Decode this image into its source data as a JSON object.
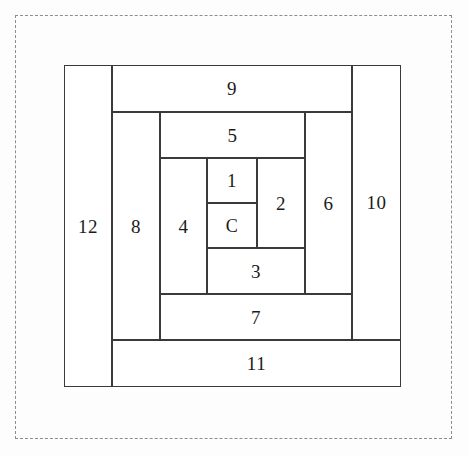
{
  "diagram": {
    "type": "log-cabin-quilt-block",
    "center_label": "C",
    "stroke_color": "#3a3a3a",
    "background_color": "#ffffff",
    "dashed_border_color": "#8d8d8d",
    "label_color": "#1b1b1b",
    "outer_boundary_style": "dashed",
    "pieces": [
      {
        "id": "center",
        "label": "C",
        "orientation": "square",
        "x": 143,
        "y": 138,
        "w": 50,
        "h": 45
      },
      {
        "id": "p1",
        "label": "1",
        "orientation": "horizontal",
        "x": 143,
        "y": 93,
        "w": 50,
        "h": 45
      },
      {
        "id": "p2",
        "label": "2",
        "orientation": "vertical",
        "x": 193,
        "y": 93,
        "w": 48,
        "h": 90
      },
      {
        "id": "p3",
        "label": "3",
        "orientation": "horizontal",
        "x": 143,
        "y": 183,
        "w": 98,
        "h": 46
      },
      {
        "id": "p4",
        "label": "4",
        "orientation": "vertical",
        "x": 96,
        "y": 93,
        "w": 47,
        "h": 136
      },
      {
        "id": "p5",
        "label": "5",
        "orientation": "horizontal",
        "x": 96,
        "y": 47,
        "w": 145,
        "h": 46
      },
      {
        "id": "p6",
        "label": "6",
        "orientation": "vertical",
        "x": 241,
        "y": 47,
        "w": 47,
        "h": 182
      },
      {
        "id": "p7",
        "label": "7",
        "orientation": "horizontal",
        "x": 96,
        "y": 229,
        "w": 192,
        "h": 46
      },
      {
        "id": "p8",
        "label": "8",
        "orientation": "vertical",
        "x": 48,
        "y": 47,
        "w": 48,
        "h": 228
      },
      {
        "id": "p9",
        "label": "9",
        "orientation": "horizontal",
        "x": 48,
        "y": 0,
        "w": 240,
        "h": 47
      },
      {
        "id": "p10",
        "label": "10",
        "orientation": "vertical",
        "x": 288,
        "y": 0,
        "w": 49,
        "h": 275
      },
      {
        "id": "p11",
        "label": "11",
        "orientation": "horizontal",
        "x": 48,
        "y": 275,
        "w": 289,
        "h": 47
      },
      {
        "id": "p12",
        "label": "12",
        "orientation": "vertical",
        "x": 0,
        "y": 0,
        "w": 48,
        "h": 322
      }
    ]
  }
}
